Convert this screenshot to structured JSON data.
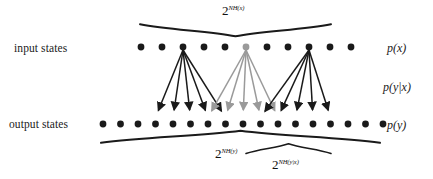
{
  "figure": {
    "width": 433,
    "height": 179,
    "background": "#ffffff",
    "dark_color": "#1a1a1a",
    "gray_color": "#9a9a9a"
  },
  "labels": {
    "input_states": "input states",
    "output_states": "output states",
    "p_x": "p(x)",
    "p_y_given_x": "p(y|x)",
    "p_y": "p(y)"
  },
  "braces": {
    "top": {
      "base": "2",
      "exponent": "NH(x)",
      "full": "2^NH(x)",
      "x_start": 140,
      "x_end": 331,
      "y": 31
    },
    "bottom_wide": {
      "base": "2",
      "exponent": "NH(y)",
      "full": "2^NH(y)",
      "x_start": 101,
      "x_end": 380,
      "y": 136
    },
    "bottom_narrow": {
      "base": "2",
      "exponent": "NH(y|x)",
      "full": "2^NH(y|x)",
      "x_start": 246,
      "x_end": 331,
      "y": 148
    }
  },
  "chart_data": {
    "type": "diagram",
    "input_row": {
      "label": "input states",
      "y": 47,
      "count": 11,
      "x_start": 141,
      "spacing": 21,
      "dot_radius": 3.4,
      "source_indices": [
        2,
        5,
        8
      ],
      "source_colors": [
        "#1a1a1a",
        "#9a9a9a",
        "#1a1a1a"
      ]
    },
    "output_row": {
      "label": "output states",
      "y": 124,
      "count": 17,
      "x_start": 103,
      "spacing": 17.5,
      "dot_radius": 3.4
    },
    "fans": [
      {
        "source_index": 2,
        "color": "#1a1a1a",
        "target_indices": [
          3,
          4,
          5,
          6,
          7
        ]
      },
      {
        "source_index": 5,
        "color": "#9a9a9a",
        "target_indices": [
          6,
          7,
          8,
          9,
          10
        ]
      },
      {
        "source_index": 8,
        "color": "#1a1a1a",
        "target_indices": [
          9,
          10,
          11,
          12,
          13
        ]
      }
    ],
    "annotations": [
      {
        "text": "2^NH(x)",
        "position": "top-center",
        "describes": "input typical set size"
      },
      {
        "text": "2^NH(y)",
        "position": "bottom-center",
        "describes": "output typical set size"
      },
      {
        "text": "2^NH(y|x)",
        "position": "bottom-right",
        "describes": "conditional typical set size"
      },
      {
        "text": "p(x)",
        "position": "right-top"
      },
      {
        "text": "p(y|x)",
        "position": "right-middle"
      },
      {
        "text": "p(y)",
        "position": "right-bottom"
      }
    ]
  }
}
